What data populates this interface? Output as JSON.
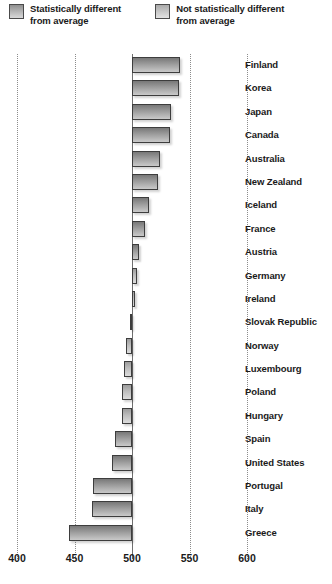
{
  "legend": {
    "items": [
      {
        "key": "sig",
        "label": "Statistically different\nfrom average",
        "swatch_color": "#9d9d9d"
      },
      {
        "key": "notsig",
        "label": "Not statistically different\nfrom average",
        "swatch_color": "#bdbdbd"
      }
    ]
  },
  "chart_data": {
    "type": "bar",
    "orientation": "horizontal",
    "title": "",
    "subtitle": "",
    "xlabel": "",
    "ylabel": "",
    "xlim": [
      400,
      600
    ],
    "xticks": [
      400,
      450,
      500,
      550,
      600
    ],
    "xticklabels": [
      "400",
      "450",
      "500",
      "550",
      "600"
    ],
    "baseline": 500,
    "grid": true,
    "legend_position": "top",
    "categories": [
      "Finland",
      "Korea",
      "Japan",
      "Canada",
      "Australia",
      "New Zealand",
      "Iceland",
      "France",
      "Austria",
      "Germany",
      "Ireland",
      "Slovak Republic",
      "Norway",
      "Luxembourg",
      "Poland",
      "Hungary",
      "Spain",
      "United States",
      "Portugal",
      "Italy",
      "Greece"
    ],
    "values": [
      542,
      541,
      534,
      533,
      524,
      523,
      515,
      511,
      506,
      504,
      503,
      498,
      495,
      493,
      491,
      491,
      485,
      483,
      466,
      465,
      445
    ],
    "significance": [
      "sig",
      "sig",
      "sig",
      "sig",
      "sig",
      "sig",
      "sig",
      "sig",
      "sig",
      "notsig",
      "notsig",
      "notsig",
      "notsig",
      "notsig",
      "notsig",
      "notsig",
      "sig",
      "sig",
      "sig",
      "sig",
      "sig"
    ]
  }
}
